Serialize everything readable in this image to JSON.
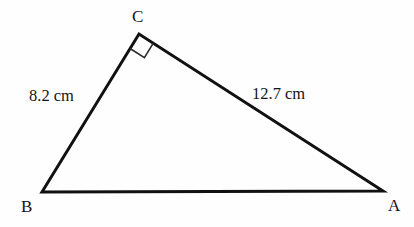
{
  "figure": {
    "type": "right-triangle-diagram",
    "background_color": "#fefefe",
    "stroke_color": "#111111",
    "text_color": "#141414",
    "stroke_width": 3,
    "vertices": {
      "A": {
        "label": "A",
        "x": 383,
        "y": 191,
        "label_x": 388,
        "label_y": 197
      },
      "B": {
        "label": "B",
        "x": 42,
        "y": 192,
        "label_x": 21,
        "label_y": 198
      },
      "C": {
        "label": "C",
        "x": 139,
        "y": 34,
        "label_x": 132,
        "label_y": 8
      }
    },
    "sides": [
      {
        "name": "BC",
        "from": "B",
        "to": "C",
        "label": "8.2 cm",
        "label_x": 29,
        "label_y": 88
      },
      {
        "name": "CA",
        "from": "C",
        "to": "A",
        "label": "12.7 cm",
        "label_x": 252,
        "label_y": 86
      },
      {
        "name": "BA",
        "from": "B",
        "to": "A",
        "label": "",
        "label_x": 0,
        "label_y": 0
      }
    ],
    "right_angle": {
      "at_vertex": "C",
      "marker": "right-angle-square",
      "size": 17
    }
  }
}
